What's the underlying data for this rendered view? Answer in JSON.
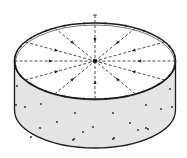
{
  "diagram": {
    "radial_line_count": 12,
    "arrow_direction": "inward",
    "colors": {
      "outline": "#1a1a1a",
      "side_fill": "#e4e4e4",
      "top_fill": "#ffffff",
      "dashed_line": "#222222",
      "dots": "#222222"
    },
    "side_dot_count": 23
  }
}
